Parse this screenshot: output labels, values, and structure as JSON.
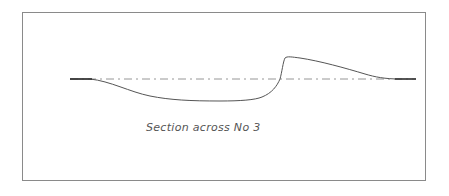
{
  "diagram": {
    "caption": "Section across No 3",
    "colors": {
      "frame": "#8a8a8a",
      "profile_line": "#555555",
      "datum_line": "#8a8a8a",
      "background": "#ffffff"
    },
    "elements": [
      {
        "type": "frame",
        "description": "rectangular border"
      },
      {
        "type": "datum-line",
        "style": "dash-dot",
        "description": "horizontal reference line"
      },
      {
        "type": "profile-curve",
        "description": "cross-section profile dipping below datum then rising sharply above it"
      }
    ]
  }
}
